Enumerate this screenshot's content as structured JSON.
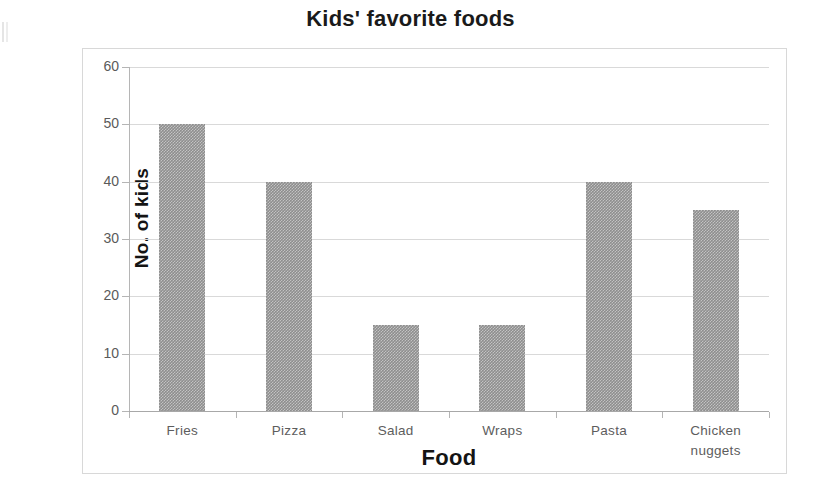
{
  "chart_data": {
    "type": "bar",
    "title": "Kids' favorite foods",
    "xlabel": "Food",
    "ylabel": "No. of kids",
    "categories": [
      "Fries",
      "Pizza",
      "Salad",
      "Wraps",
      "Pasta",
      "Chicken nuggets"
    ],
    "category_lines": [
      [
        "Fries"
      ],
      [
        "Pizza"
      ],
      [
        "Salad"
      ],
      [
        "Wraps"
      ],
      [
        "Pasta"
      ],
      [
        "Chicken",
        "nuggets"
      ]
    ],
    "values": [
      50,
      40,
      15,
      15,
      40,
      35
    ],
    "ylim": [
      0,
      60
    ],
    "ytick_labels": [
      "60",
      "50",
      "40",
      "30",
      "20",
      "10",
      "0"
    ],
    "ytick_values": [
      60,
      50,
      40,
      30,
      20,
      10,
      0
    ],
    "grid": true,
    "legend": "none",
    "colors": {
      "bar_fill": "#8e8e8e",
      "gridline": "#d9d9d9",
      "axis_line": "#b5b5b5",
      "frame_border": "#d8d8d8",
      "tick_label": "#5a5a5a",
      "title_text": "#1a1a1a",
      "background": "#ffffff"
    }
  }
}
